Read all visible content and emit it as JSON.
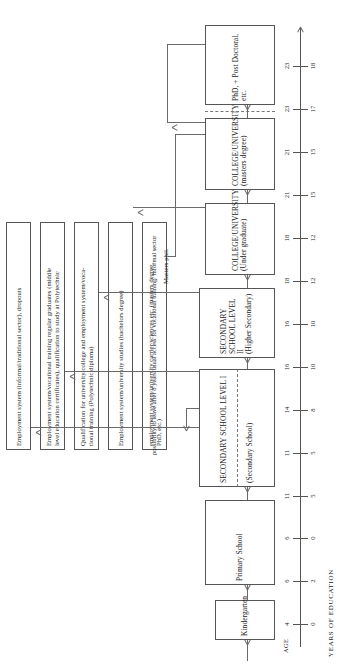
{
  "diagram": {
    "axis": {
      "age_label": "AGE",
      "years_label": "YEARS OF EDUCATION",
      "age_ticks": [
        "4",
        "6",
        "6",
        "11",
        "11",
        "14",
        "16",
        "16",
        "18",
        "18",
        "21",
        "21",
        "23",
        "23"
      ],
      "years_ticks": [
        "0",
        "2",
        "0",
        "5",
        "5",
        "8",
        "10",
        "10",
        "12",
        "12",
        "15",
        "15",
        "17",
        "18"
      ]
    },
    "stages": [
      {
        "id": "kindergarten",
        "title": "Kindergarten",
        "sub": ""
      },
      {
        "id": "primary-school",
        "title": "Primary School",
        "sub": ""
      },
      {
        "id": "secondary-school-level-1",
        "title": "SECONDARY SCHOOL LEVEL I",
        "sub": "(Secondary School)"
      },
      {
        "id": "secondary-school-level-2",
        "title": "SECONDARY SCHOOL LEVEL II",
        "sub": "(Higher Secondary)"
      },
      {
        "id": "college-university-undergraduate",
        "title": "COLLEGE/UNIVERSITY",
        "sub": "(Under graduate)"
      },
      {
        "id": "college-university-masters",
        "title": "COLLEGE/UNIVERSITY",
        "sub": "(masters degree)"
      },
      {
        "id": "phd-post-doctoral",
        "title": "PhD, + Post Doctoral,",
        "sub": "etc."
      }
    ],
    "outcomes": [
      {
        "id": "informal-sector",
        "line1": "Employment system (informal/traditional sector), dropouts",
        "line2": ""
      },
      {
        "id": "vocational-training-graduates",
        "line1": "Employment system/vocational training regular graduates (middle",
        "line2": "level education certificates), qualification to study at Polytechnic"
      },
      {
        "id": "polytechnic-diploma",
        "line1": "Qualification for university/college and employment system/voca-",
        "line2": "tional training (Polytechnic diploma)"
      },
      {
        "id": "bachelors-degree",
        "line1": "Employment system/university studies (bachelors degree)",
        "line2": ""
      },
      {
        "id": "masters-phd-career",
        "line1": "employment system/university carrier/sciences etc. (masters degree,",
        "line2": "PhD, etc.)"
      }
    ],
    "annotations": {
      "masters_phil": "Masters phil.",
      "leave_note_line1": "possibility to leave after",
      "leave_note_line2": "8 years/usual access for",
      "leave_note_line3": "vocational training/",
      "leave_note_line4": "informal sector"
    }
  }
}
